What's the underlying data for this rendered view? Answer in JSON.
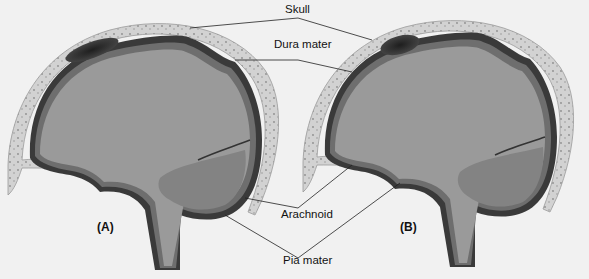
{
  "figure": {
    "labels": {
      "skull": "Skull",
      "dura_mater": "Dura mater",
      "arachnoid": "Arachnoid",
      "pia_mater": "Pia mater"
    },
    "panels": [
      {
        "id": "A",
        "label": "(A)"
      },
      {
        "id": "B",
        "label": "(B)"
      }
    ]
  },
  "colors": {
    "background": "#f1f1f1",
    "brain": "#9a9a9a",
    "cerebellum": "#808080",
    "membrane_dark": "#3a3a3a",
    "membrane_mid": "#6e6e6e",
    "skull_bone": "#cfcfcf",
    "hematoma": "#2a2a2a",
    "leader_line": "#222222"
  }
}
